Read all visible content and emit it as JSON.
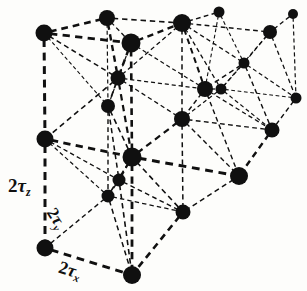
{
  "figure": {
    "background_color": "#fdfdfb",
    "ink_color": "#101010",
    "width": 307,
    "height": 291
  },
  "labels": {
    "z_axis": {
      "coefficient": "2",
      "symbol": "τ",
      "subscript": "z",
      "text": "2τz"
    },
    "y_axis": {
      "coefficient": "2",
      "symbol": "τ",
      "subscript": "y",
      "text": "2τy"
    },
    "x_axis": {
      "coefficient": "2",
      "symbol": "τ",
      "subscript": "x",
      "text": "2τx"
    }
  },
  "chart_data": {
    "type": "scatter",
    "xlabel": "2τx",
    "ylabel": "2τy",
    "zlabel": "2τz",
    "xlim": [
      0,
      307
    ],
    "ylim": [
      0,
      291
    ],
    "grid": false,
    "legend": "none",
    "annotations": [
      "2τz",
      "2τy",
      "2τx"
    ],
    "nodes": [
      {
        "id": "n0",
        "x": 44,
        "y": 33,
        "r": 8.5
      },
      {
        "id": "n1",
        "x": 107,
        "y": 18,
        "r": 8.0
      },
      {
        "id": "n2",
        "x": 131,
        "y": 43,
        "r": 9.5
      },
      {
        "id": "n3",
        "x": 182,
        "y": 23,
        "r": 9.0
      },
      {
        "id": "n4",
        "x": 219,
        "y": 12,
        "r": 5.5
      },
      {
        "id": "n5",
        "x": 270,
        "y": 32,
        "r": 7.0
      },
      {
        "id": "n6",
        "x": 293,
        "y": 14,
        "r": 5.0
      },
      {
        "id": "n7",
        "x": 118,
        "y": 78,
        "r": 7.5
      },
      {
        "id": "n8",
        "x": 108,
        "y": 106,
        "r": 7.0
      },
      {
        "id": "n9",
        "x": 244,
        "y": 63,
        "r": 5.5
      },
      {
        "id": "n10",
        "x": 205,
        "y": 89,
        "r": 8.0
      },
      {
        "id": "n11",
        "x": 221,
        "y": 89,
        "r": 5.5
      },
      {
        "id": "n12",
        "x": 296,
        "y": 98,
        "r": 5.5
      },
      {
        "id": "n13",
        "x": 45,
        "y": 139,
        "r": 8.5
      },
      {
        "id": "n14",
        "x": 132,
        "y": 157,
        "r": 9.5
      },
      {
        "id": "n15",
        "x": 182,
        "y": 119,
        "r": 8.0
      },
      {
        "id": "n16",
        "x": 272,
        "y": 130,
        "r": 7.5
      },
      {
        "id": "n17",
        "x": 119,
        "y": 180,
        "r": 6.5
      },
      {
        "id": "n18",
        "x": 108,
        "y": 196,
        "r": 6.5
      },
      {
        "id": "n19",
        "x": 239,
        "y": 176,
        "r": 9.0
      },
      {
        "id": "n20",
        "x": 183,
        "y": 212,
        "r": 7.5
      },
      {
        "id": "n21",
        "x": 45,
        "y": 248,
        "r": 8.5
      },
      {
        "id": "n22",
        "x": 132,
        "y": 275,
        "r": 9.0
      }
    ],
    "edges": [
      {
        "from": "n0",
        "to": "n1",
        "w": 2.6
      },
      {
        "from": "n0",
        "to": "n2",
        "w": 2.8
      },
      {
        "from": "n0",
        "to": "n7",
        "w": 1.5
      },
      {
        "from": "n0",
        "to": "n13",
        "w": 3.0
      },
      {
        "from": "n1",
        "to": "n2",
        "w": 1.3
      },
      {
        "from": "n1",
        "to": "n3",
        "w": 1.6
      },
      {
        "from": "n1",
        "to": "n7",
        "w": 2.4
      },
      {
        "from": "n1",
        "to": "n8",
        "w": 1.2
      },
      {
        "from": "n2",
        "to": "n3",
        "w": 2.4
      },
      {
        "from": "n2",
        "to": "n7",
        "w": 2.4
      },
      {
        "from": "n2",
        "to": "n14",
        "w": 2.6
      },
      {
        "from": "n2",
        "to": "n10",
        "w": 1.2
      },
      {
        "from": "n3",
        "to": "n4",
        "w": 1.4
      },
      {
        "from": "n3",
        "to": "n5",
        "w": 1.4
      },
      {
        "from": "n3",
        "to": "n9",
        "w": 1.3
      },
      {
        "from": "n3",
        "to": "n10",
        "w": 2.0
      },
      {
        "from": "n3",
        "to": "n11",
        "w": 1.3
      },
      {
        "from": "n3",
        "to": "n15",
        "w": 1.5
      },
      {
        "from": "n3",
        "to": "n7",
        "w": 1.3
      },
      {
        "from": "n4",
        "to": "n9",
        "w": 1.1
      },
      {
        "from": "n4",
        "to": "n10",
        "w": 1.1
      },
      {
        "from": "n5",
        "to": "n6",
        "w": 1.3
      },
      {
        "from": "n5",
        "to": "n9",
        "w": 1.3
      },
      {
        "from": "n5",
        "to": "n12",
        "w": 1.3
      },
      {
        "from": "n5",
        "to": "n11",
        "w": 1.2
      },
      {
        "from": "n6",
        "to": "n12",
        "w": 1.2
      },
      {
        "from": "n7",
        "to": "n8",
        "w": 1.8
      },
      {
        "from": "n7",
        "to": "n14",
        "w": 2.2
      },
      {
        "from": "n7",
        "to": "n13",
        "w": 1.6
      },
      {
        "from": "n7",
        "to": "n15",
        "w": 1.3
      },
      {
        "from": "n8",
        "to": "n14",
        "w": 1.6
      },
      {
        "from": "n8",
        "to": "n17",
        "w": 1.5
      },
      {
        "from": "n8",
        "to": "n18",
        "w": 1.4
      },
      {
        "from": "n9",
        "to": "n11",
        "w": 1.3
      },
      {
        "from": "n9",
        "to": "n10",
        "w": 1.5
      },
      {
        "from": "n9",
        "to": "n12",
        "w": 1.2
      },
      {
        "from": "n9",
        "to": "n16",
        "w": 1.4
      },
      {
        "from": "n10",
        "to": "n11",
        "w": 1.3
      },
      {
        "from": "n10",
        "to": "n15",
        "w": 1.4
      },
      {
        "from": "n10",
        "to": "n16",
        "w": 1.3
      },
      {
        "from": "n10",
        "to": "n19",
        "w": 1.4
      },
      {
        "from": "n11",
        "to": "n16",
        "w": 1.2
      },
      {
        "from": "n11",
        "to": "n12",
        "w": 1.1
      },
      {
        "from": "n12",
        "to": "n16",
        "w": 1.4
      },
      {
        "from": "n13",
        "to": "n14",
        "w": 2.8
      },
      {
        "from": "n13",
        "to": "n21",
        "w": 3.0
      },
      {
        "from": "n14",
        "to": "n15",
        "w": 2.2
      },
      {
        "from": "n14",
        "to": "n17",
        "w": 2.0
      },
      {
        "from": "n14",
        "to": "n18",
        "w": 1.6
      },
      {
        "from": "n14",
        "to": "n19",
        "w": 3.0
      },
      {
        "from": "n14",
        "to": "n20",
        "w": 1.6
      },
      {
        "from": "n14",
        "to": "n22",
        "w": 2.8
      },
      {
        "from": "n15",
        "to": "n16",
        "w": 1.4
      },
      {
        "from": "n15",
        "to": "n19",
        "w": 1.4
      },
      {
        "from": "n15",
        "to": "n20",
        "w": 1.5
      },
      {
        "from": "n16",
        "to": "n19",
        "w": 2.4
      },
      {
        "from": "n17",
        "to": "n18",
        "w": 1.5
      },
      {
        "from": "n17",
        "to": "n20",
        "w": 1.4
      },
      {
        "from": "n17",
        "to": "n22",
        "w": 1.6
      },
      {
        "from": "n18",
        "to": "n20",
        "w": 1.3
      },
      {
        "from": "n18",
        "to": "n21",
        "w": 1.4
      },
      {
        "from": "n18",
        "to": "n22",
        "w": 1.5
      },
      {
        "from": "n20",
        "to": "n22",
        "w": 2.6
      },
      {
        "from": "n21",
        "to": "n22",
        "w": 3.0
      },
      {
        "from": "n2",
        "to": "n8",
        "w": 1.2
      },
      {
        "from": "n0",
        "to": "n8",
        "w": 1.1
      },
      {
        "from": "n7",
        "to": "n10",
        "w": 1.2
      },
      {
        "from": "n15",
        "to": "n11",
        "w": 1.2
      },
      {
        "from": "n19",
        "to": "n20",
        "w": 1.5
      },
      {
        "from": "n13",
        "to": "n17",
        "w": 1.3
      },
      {
        "from": "n13",
        "to": "n18",
        "w": 1.2
      }
    ]
  }
}
